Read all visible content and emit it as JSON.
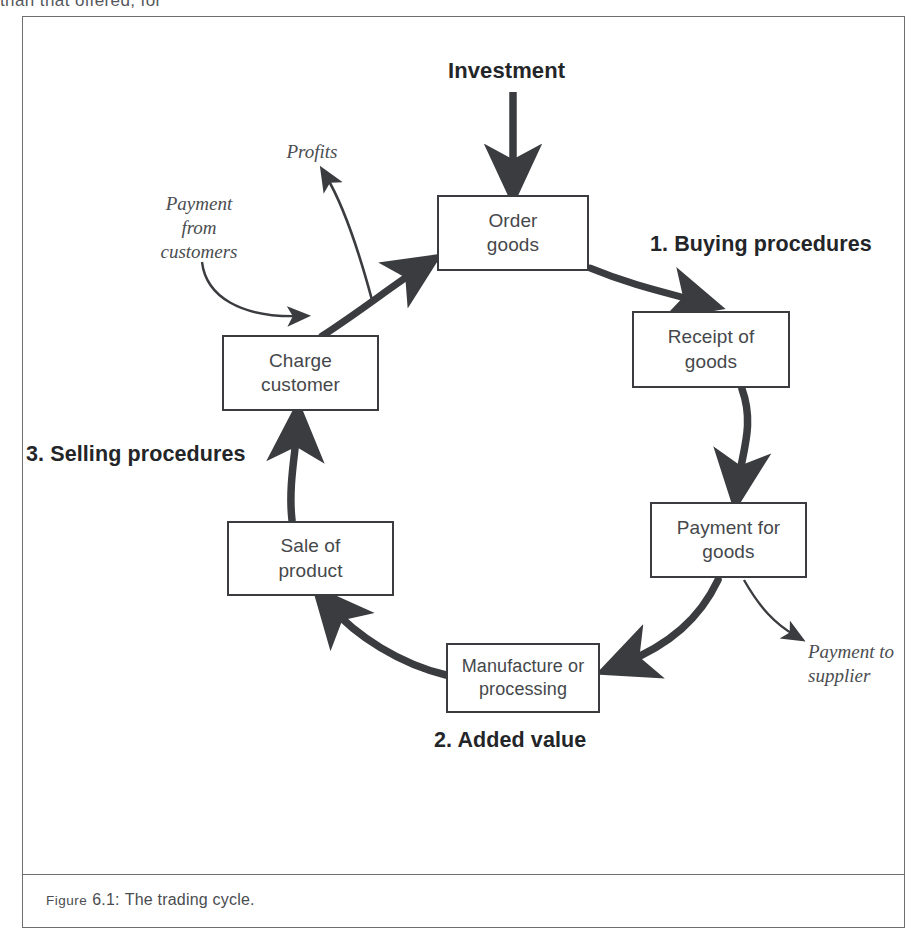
{
  "page": {
    "cut_off_body_text": "than that offered, for"
  },
  "figure": {
    "caption_prefix": "Figure",
    "caption_number": "6.1:",
    "caption_text": "The trading cycle."
  },
  "diagram": {
    "title": "The trading cycle",
    "type": "cycle-flow",
    "nodes": [
      {
        "id": "order-goods",
        "label": "Order\ngoods",
        "x": 437,
        "y": 195,
        "w": 152,
        "h": 76
      },
      {
        "id": "receipt-goods",
        "label": "Receipt of\ngoods",
        "x": 632,
        "y": 311,
        "w": 158,
        "h": 77
      },
      {
        "id": "payment-goods",
        "label": "Payment for\ngoods",
        "x": 650,
        "y": 502,
        "w": 157,
        "h": 76
      },
      {
        "id": "manufacture",
        "label": "Manufacture or\nprocessing",
        "x": 446,
        "y": 643,
        "w": 154,
        "h": 70
      },
      {
        "id": "sale-product",
        "label": "Sale of\nproduct",
        "x": 227,
        "y": 521,
        "w": 167,
        "h": 75
      },
      {
        "id": "charge-cust",
        "label": "Charge\ncustomer",
        "x": 222,
        "y": 335,
        "w": 157,
        "h": 76
      }
    ],
    "stage_labels": [
      {
        "id": "stage-1",
        "label": "1. Buying procedures",
        "x": 650,
        "y": 232
      },
      {
        "id": "stage-2",
        "label": "2. Added value",
        "x": 434,
        "y": 728
      },
      {
        "id": "stage-3",
        "label": "3. Selling procedures",
        "x": 26,
        "y": 442
      }
    ],
    "flow_labels": [
      {
        "id": "investment",
        "label": "Investment",
        "x": 448,
        "y": 58,
        "w": 156,
        "style": "bold"
      },
      {
        "id": "profits",
        "label": "Profits",
        "x": 262,
        "y": 140,
        "w": 100,
        "style": "italic"
      },
      {
        "id": "payment-from-cust",
        "label": "Payment\nfrom\ncustomers",
        "x": 139,
        "y": 192,
        "w": 120,
        "style": "italic"
      },
      {
        "id": "payment-to-supplier",
        "label": "Payment to\nsupplier",
        "x": 812,
        "y": 640,
        "w": 112,
        "style": "italic"
      }
    ],
    "edges": [
      {
        "id": "edge-investment-to-order",
        "from": "Investment",
        "to": "Order goods",
        "weight": "thick"
      },
      {
        "id": "edge-order-to-receipt",
        "from": "Order goods",
        "to": "Receipt of goods",
        "weight": "thick"
      },
      {
        "id": "edge-receipt-to-payment",
        "from": "Receipt of goods",
        "to": "Payment for goods",
        "weight": "thick"
      },
      {
        "id": "edge-payment-to-manu",
        "from": "Payment for goods",
        "to": "Manufacture or processing",
        "weight": "thick"
      },
      {
        "id": "edge-manu-to-sale",
        "from": "Manufacture or processing",
        "to": "Sale of product",
        "weight": "thick"
      },
      {
        "id": "edge-sale-to-charge",
        "from": "Sale of product",
        "to": "Charge customer",
        "weight": "thick"
      },
      {
        "id": "edge-charge-to-order",
        "from": "Charge customer",
        "to": "Order goods",
        "weight": "thick"
      },
      {
        "id": "edge-payment-to-supplier",
        "from": "Payment for goods",
        "to": "Payment to supplier",
        "weight": "thin"
      },
      {
        "id": "edge-custpayment-to-order",
        "from": "Payment from customers",
        "to": "Order goods",
        "weight": "thin"
      },
      {
        "id": "edge-order-to-profits",
        "from": "Order goods",
        "to": "Profits",
        "weight": "thin"
      }
    ]
  },
  "colors": {
    "ink": "#3a3c3f",
    "text": "#45484b",
    "frame": "#6d6f72",
    "bold_text": "#232528",
    "background": "#ffffff"
  }
}
